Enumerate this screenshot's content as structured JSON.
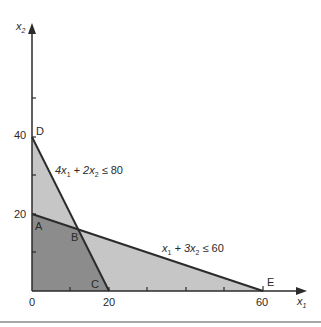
{
  "diagram": {
    "type": "linear-programming-feasible-region",
    "axes": {
      "x": {
        "label": "x",
        "subscript": "1",
        "ticks": [
          0,
          10,
          20,
          30,
          40,
          50,
          60
        ],
        "tick_labels": [
          "0",
          "20",
          "60"
        ]
      },
      "y": {
        "label": "x",
        "subscript": "2",
        "ticks": [
          0,
          10,
          20,
          30,
          40,
          50
        ],
        "tick_labels": [
          "20",
          "40"
        ]
      }
    },
    "tick_labels": {
      "x0": "0",
      "x20": "20",
      "x60": "60",
      "y20": "20",
      "y40": "40"
    },
    "points": {
      "A": {
        "label": "A",
        "x1": 0,
        "x2": 20
      },
      "B": {
        "label": "B",
        "x1": 12,
        "x2": 16
      },
      "C": {
        "label": "C",
        "x1": 20,
        "x2": 0
      },
      "D": {
        "label": "D",
        "x1": 0,
        "x2": 40
      },
      "E": {
        "label": "E",
        "x1": 60,
        "x2": 0
      }
    },
    "constraints": [
      {
        "id": "c1",
        "lhs_a": "4x",
        "s1": "1",
        "plus": " + 2x",
        "s2": "2",
        "rhs": " ≤ 80"
      },
      {
        "id": "c2",
        "lhs_a": "x",
        "s1": "1",
        "plus": " + 3x",
        "s2": "2",
        "rhs": " ≤ 60"
      }
    ],
    "regions": {
      "feasible_both": {
        "vertices": [
          "O",
          "A",
          "B",
          "C"
        ],
        "color": "#8c8c8c"
      },
      "single_constraint": {
        "vertices": [
          "A",
          "D",
          "B",
          "E",
          "C"
        ],
        "color": "#c6c6c6"
      }
    },
    "colors": {
      "line": "#2b2b2b",
      "dark_region": "#8c8c8c",
      "light_region": "#c6c6c6",
      "separator": "#8a8a8a"
    }
  }
}
